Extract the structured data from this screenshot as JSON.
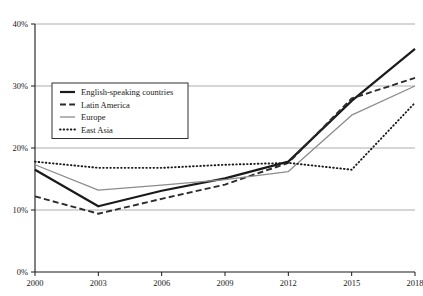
{
  "chart_data": {
    "type": "line",
    "title": "",
    "subtitle": "",
    "xlabel": "",
    "ylabel": "",
    "x": [
      2000,
      2003,
      2006,
      2009,
      2012,
      2015,
      2018
    ],
    "xtick_labels": [
      "2000",
      "2003",
      "2006",
      "2009",
      "2012",
      "2015",
      "2018"
    ],
    "ytick_labels": [
      "0%",
      "10%",
      "20%",
      "30%",
      "40%"
    ],
    "ytick_values": [
      0,
      10,
      20,
      30,
      40
    ],
    "xlim": [
      2000,
      2018
    ],
    "ylim": [
      0,
      40
    ],
    "grid": "horizontal",
    "legend_position": "upper-left-inside",
    "series": [
      {
        "name": "English-speaking countries",
        "style": "solid-thick",
        "color": "#1a1a1a",
        "values": [
          16.5,
          10.6,
          13.1,
          15.1,
          17.8,
          27.6,
          36.0
        ]
      },
      {
        "name": "Latin America",
        "style": "dashed",
        "color": "#2b2b2b",
        "values": [
          12.2,
          9.4,
          11.8,
          14.1,
          17.6,
          28.0,
          31.3
        ]
      },
      {
        "name": "Europe",
        "style": "solid-thin",
        "color": "#8c8c8c",
        "values": [
          17.3,
          13.2,
          14.0,
          14.9,
          16.2,
          25.3,
          30.0
        ]
      },
      {
        "name": "East Asia",
        "style": "dotted",
        "color": "#1a1a1a",
        "values": [
          17.8,
          16.8,
          16.8,
          17.3,
          17.6,
          16.5,
          27.3
        ]
      }
    ]
  },
  "legend": {
    "items": [
      {
        "label": "English-speaking countries"
      },
      {
        "label": "Latin America"
      },
      {
        "label": "Europe"
      },
      {
        "label": "East Asia"
      }
    ]
  },
  "axes": {
    "y_axis_name": "percentage-axis",
    "x_axis_name": "year-axis"
  }
}
